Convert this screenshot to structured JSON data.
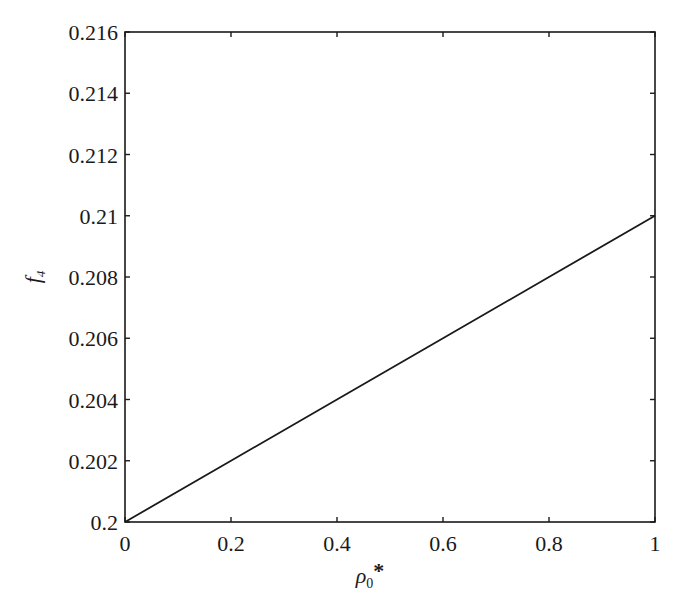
{
  "chart_data": {
    "type": "line",
    "title": "",
    "xlabel": "ρ0*",
    "ylabel": "f4",
    "xlabel_parts": {
      "base": "ρ",
      "sub": "0",
      "sup": "*"
    },
    "ylabel_parts": {
      "base": "f",
      "sub": "4"
    },
    "xlim": [
      0,
      1
    ],
    "ylim": [
      0.2,
      0.216
    ],
    "x_ticks": [
      0,
      0.2,
      0.4,
      0.6,
      0.8,
      1
    ],
    "x_tick_labels": [
      "0",
      "0.2",
      "0.4",
      "0.6",
      "0.8",
      "1"
    ],
    "y_ticks": [
      0.2,
      0.202,
      0.204,
      0.206,
      0.208,
      0.21,
      0.212,
      0.214,
      0.216
    ],
    "y_tick_labels": [
      "0.2",
      "0.202",
      "0.204",
      "0.206",
      "0.208",
      "0.21",
      "0.212",
      "0.214",
      "0.216"
    ],
    "grid": false,
    "legend": null,
    "series": [
      {
        "name": "f4",
        "color": "#1a1a1a",
        "x": [
          0,
          0.2,
          0.4,
          0.6,
          0.8,
          1
        ],
        "y": [
          0.2,
          0.202,
          0.204,
          0.206,
          0.208,
          0.21
        ]
      }
    ]
  }
}
